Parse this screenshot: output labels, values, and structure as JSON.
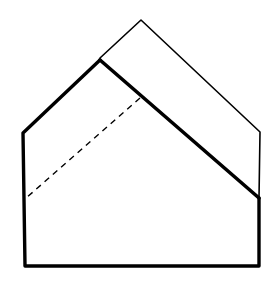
{
  "diagram": {
    "canvas": {
      "width": 276,
      "height": 287,
      "background": "#ffffff"
    },
    "stroke_color": "#000000",
    "outer_flap": {
      "label": "unfolded back layer (thin outline)",
      "points": [
        [
          100,
          58
        ],
        [
          141,
          20
        ],
        [
          260,
          132
        ],
        [
          259,
          198
        ]
      ],
      "stroke_width": 1.6
    },
    "front_body": {
      "label": "folded front layer (thick outline)",
      "points": [
        [
          100,
          60
        ],
        [
          23,
          133
        ],
        [
          25,
          266
        ],
        [
          259,
          266
        ],
        [
          259,
          198
        ]
      ],
      "stroke_width": 3.4
    },
    "fold_edge": {
      "label": "thick diagonal fold edge",
      "from": [
        100,
        60
      ],
      "to": [
        259,
        198
      ],
      "stroke_width": 3.6
    },
    "dashed_fold_line": {
      "label": "valley fold guide",
      "from": [
        140,
        98
      ],
      "to": [
        25,
        199
      ],
      "stroke_width": 1.4,
      "dash": "6,5"
    }
  }
}
